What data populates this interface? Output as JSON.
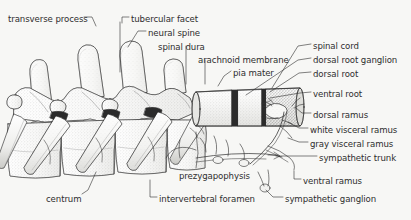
{
  "figure": {
    "background_color": "#f7f7f5",
    "ink_color": "#2e2e2e",
    "style": "pen-and-ink stipple anatomical illustration"
  },
  "labels": [
    {
      "id": "transverse-process",
      "text": "transverse process",
      "x": 8,
      "y": 14,
      "align": "left"
    },
    {
      "id": "tubercular-facet",
      "text": "tubercular facet",
      "x": 131,
      "y": 14,
      "align": "left"
    },
    {
      "id": "neural-spine",
      "text": "neural spine",
      "x": 148,
      "y": 28,
      "align": "left"
    },
    {
      "id": "spinal-dura",
      "text": "spinal dura",
      "x": 158,
      "y": 42,
      "align": "left"
    },
    {
      "id": "arachnoid-membrane",
      "text": "arachnoid membrane",
      "x": 198,
      "y": 55,
      "align": "left"
    },
    {
      "id": "pia-mater",
      "text": "pia mater",
      "x": 233,
      "y": 68,
      "align": "left"
    },
    {
      "id": "spinal-cord",
      "text": "spinal cord",
      "x": 313,
      "y": 41,
      "align": "left"
    },
    {
      "id": "dorsal-root-ganglion",
      "text": "dorsal root ganglion",
      "x": 313,
      "y": 55,
      "align": "left"
    },
    {
      "id": "dorsal-root",
      "text": "dorsal root",
      "x": 313,
      "y": 69,
      "align": "left"
    },
    {
      "id": "ventral-root",
      "text": "ventral root",
      "x": 313,
      "y": 89,
      "align": "left"
    },
    {
      "id": "dorsal-ramus",
      "text": "dorsal ramus",
      "x": 313,
      "y": 110,
      "align": "left"
    },
    {
      "id": "white-visceral-ramus",
      "text": "white visceral ramus",
      "x": 310,
      "y": 125,
      "align": "left"
    },
    {
      "id": "gray-visceral-ramus",
      "text": "gray visceral ramus",
      "x": 310,
      "y": 139,
      "align": "left"
    },
    {
      "id": "sympathetic-trunk",
      "text": "sympathetic trunk",
      "x": 319,
      "y": 153,
      "align": "left"
    },
    {
      "id": "ventral-ramus",
      "text": "ventral ramus",
      "x": 303,
      "y": 176,
      "align": "left"
    },
    {
      "id": "sympathetic-ganglion",
      "text": "sympathetic ganglion",
      "x": 285,
      "y": 194,
      "align": "left"
    },
    {
      "id": "prezygapophysis",
      "text": "prezygapophysis",
      "x": 179,
      "y": 171,
      "align": "left"
    },
    {
      "id": "intervertebral-foramen",
      "text": "intervertebral foramen",
      "x": 159,
      "y": 194,
      "align": "left"
    },
    {
      "id": "centrum",
      "text": "centrum",
      "x": 46,
      "y": 194,
      "align": "left"
    }
  ],
  "leaders": [
    {
      "id": "leader-transverse-process",
      "path": "M84,17 L92,17 L96,26"
    },
    {
      "id": "leader-tubercular-facet",
      "path": "M129,17 L122,17 L122,23"
    },
    {
      "id": "leader-tubercular-facet-b",
      "path": "M120,22 L120,72"
    },
    {
      "id": "leader-neural-spine",
      "path": "M146,31 L138,31 L128,47"
    },
    {
      "id": "leader-spinal-dura",
      "path": "M186,46 L186,84"
    },
    {
      "id": "leader-arachnoid-membrane",
      "path": "M205,60 L205,84"
    },
    {
      "id": "leader-pia-mater",
      "path": "M231,71 L224,76 L218,86"
    },
    {
      "id": "leader-spinal-cord",
      "path": "M311,44 L298,46 L272,88"
    },
    {
      "id": "leader-dorsal-root-ganglion",
      "path": "M311,58 L298,60 L246,95"
    },
    {
      "id": "leader-dorsal-root",
      "path": "M311,72 L299,73 L270,92"
    },
    {
      "id": "leader-ventral-root",
      "path": "M311,92 L300,93 L270,98"
    },
    {
      "id": "leader-dorsal-ramus",
      "path": "M311,113 L302,113 L296,108"
    },
    {
      "id": "leader-white-visceral-ramus",
      "path": "M308,128 L299,128 L288,122"
    },
    {
      "id": "leader-gray-visceral-ramus",
      "path": "M308,142 L299,142 L288,138"
    },
    {
      "id": "leader-sympathetic-trunk",
      "path": "M317,156 L276,156"
    },
    {
      "id": "leader-ventral-ramus",
      "path": "M301,179 L294,179 L294,171"
    },
    {
      "id": "leader-sympathetic-ganglion",
      "path": "M283,197 L273,197 L266,190"
    },
    {
      "id": "leader-prezygapophysis",
      "path": "M196,168 L198,153 L196,132"
    },
    {
      "id": "leader-intervertebral-foramen",
      "path": "M157,197 L150,197 L150,180"
    },
    {
      "id": "leader-centrum",
      "path": "M82,194 L88,190 L96,172"
    }
  ],
  "structures": {
    "neural_spines_count": 4,
    "vertebrae_count": 5,
    "ribs_count": 4,
    "cord_segments": 3
  }
}
